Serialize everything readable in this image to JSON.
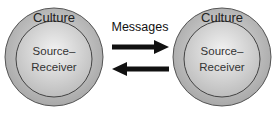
{
  "diagram": {
    "left_node": {
      "outer_label": "Culture",
      "inner_label_line1": "Source–",
      "inner_label_line2": "Receiver"
    },
    "right_node": {
      "outer_label": "Culture",
      "inner_label_line1": "Source–",
      "inner_label_line2": "Receiver"
    },
    "edge_label": "Messages",
    "edges": [
      {
        "from": "left_node",
        "to": "right_node",
        "direction": "right"
      },
      {
        "from": "right_node",
        "to": "left_node",
        "direction": "left"
      }
    ],
    "colors": {
      "outer_ring": "#b8b8b8",
      "inner_circle": "#d6d6d6",
      "stroke": "#444444",
      "arrow": "#111111"
    }
  }
}
